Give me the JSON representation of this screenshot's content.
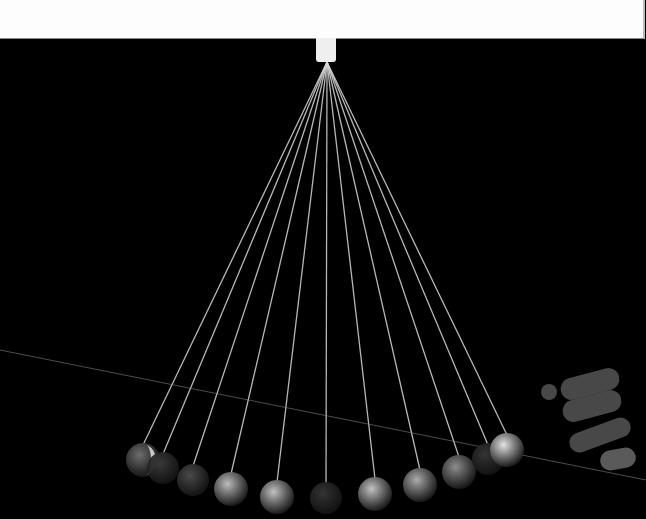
{
  "scene": {
    "description": "Long-exposure photograph of a pendulum wave apparatus against a black background",
    "background_color": "#000000",
    "banner_color": "#fdfdfd",
    "pivot": {
      "x": 327,
      "y": 62
    },
    "laser_line": {
      "x1": 0,
      "y1": 350,
      "x2": 646,
      "y2": 480,
      "color": "#8a8a8a"
    },
    "pendulums": [
      {
        "x": 143,
        "y": 460,
        "r": 17,
        "shade": "#6e6e6e",
        "highlight": "#d8d8d8"
      },
      {
        "x": 163,
        "y": 468,
        "r": 16,
        "shade": "#3a3a3a"
      },
      {
        "x": 193,
        "y": 480,
        "r": 16,
        "shade": "#4a4a4a"
      },
      {
        "x": 231,
        "y": 489,
        "r": 17,
        "shade": "#bdbdbd"
      },
      {
        "x": 277,
        "y": 497,
        "r": 17,
        "shade": "#c2c2c2"
      },
      {
        "x": 326,
        "y": 498,
        "r": 16,
        "shade": "#343434"
      },
      {
        "x": 375,
        "y": 494,
        "r": 17,
        "shade": "#c4c4c4"
      },
      {
        "x": 420,
        "y": 485,
        "r": 17,
        "shade": "#adadad"
      },
      {
        "x": 459,
        "y": 472,
        "r": 17,
        "shade": "#8e8e8e"
      },
      {
        "x": 488,
        "y": 459,
        "r": 16,
        "shade": "#353535"
      },
      {
        "x": 507,
        "y": 450,
        "r": 17,
        "shade": "#e4e4e4"
      }
    ],
    "hand": {
      "x": 540,
      "y": 365,
      "color": "#555555"
    }
  }
}
